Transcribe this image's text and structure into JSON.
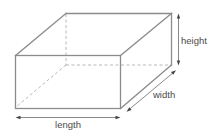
{
  "diagram": {
    "shape": "cuboid",
    "labels": {
      "length": "length",
      "width": "width",
      "height": "height"
    },
    "edges": {
      "visible": [
        "front-top",
        "front-bottom",
        "front-left",
        "front-right",
        "top-back",
        "top-left-depth",
        "top-right-depth",
        "right-back",
        "right-bottom-depth"
      ],
      "hidden": [
        "back-left-vertical",
        "back-bottom",
        "bottom-left-depth"
      ]
    },
    "dimensions": [
      {
        "name": "length",
        "edge": "front-bottom",
        "arrow": "double-headed"
      },
      {
        "name": "width",
        "edge": "right-bottom-depth",
        "arrow": "double-headed"
      },
      {
        "name": "height",
        "edge": "right-back",
        "arrow": "double-headed"
      }
    ],
    "colors": {
      "solid_edge": "#8c8c8c",
      "hidden_edge": "#b0b0b0",
      "dimension_line": "#555555",
      "label_text": "#4a4a4a"
    }
  }
}
